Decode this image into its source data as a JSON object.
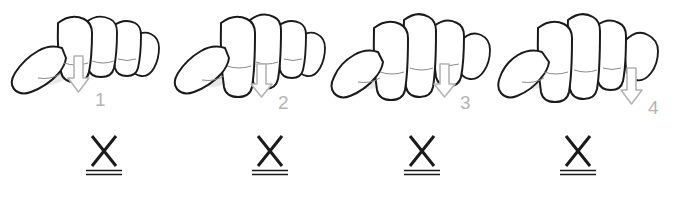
{
  "figure": {
    "background_color": "#ffffff",
    "ink_color": "#1a1a1a",
    "arrow_color": "#b4b4b4",
    "shade_color": "#e8e8e8",
    "panel_count": 4
  },
  "panels": [
    {
      "id": "panel-1",
      "finger_number": "1",
      "finger_name": "index-finger",
      "arrow_icon": "down-arrow-icon",
      "symbol": "X",
      "symbol_name": "x-double-underline-symbol",
      "hand_icon": "hand-fingers-curled-icon"
    },
    {
      "id": "panel-2",
      "finger_number": "2",
      "finger_name": "middle-finger",
      "arrow_icon": "down-arrow-icon",
      "symbol": "X",
      "symbol_name": "x-double-underline-symbol",
      "hand_icon": "hand-fingers-curled-icon"
    },
    {
      "id": "panel-3",
      "finger_number": "3",
      "finger_name": "ring-finger",
      "arrow_icon": "down-arrow-icon",
      "symbol": "X",
      "symbol_name": "x-double-underline-symbol",
      "hand_icon": "hand-fingers-curled-icon"
    },
    {
      "id": "panel-4",
      "finger_number": "4",
      "finger_name": "little-finger",
      "arrow_icon": "down-arrow-icon",
      "symbol": "X",
      "symbol_name": "x-double-underline-symbol",
      "hand_icon": "hand-fingers-curled-icon"
    }
  ]
}
